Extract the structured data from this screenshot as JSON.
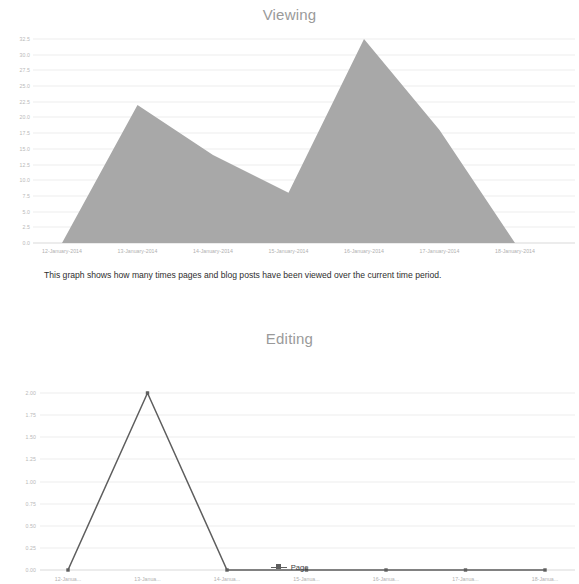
{
  "description": {
    "text": "This graph shows how many times pages and blog posts have been viewed over the current time period."
  },
  "colors": {
    "area_fill": "#a8a8a8",
    "line_stroke": "#5e5e5e",
    "title": "#9a9a9a",
    "grid": "#ededed",
    "tick_label": "#b9b9b9"
  },
  "legend": {
    "items": [
      {
        "label": "Page",
        "symbol": "line-marker",
        "color": "#5e5e5e"
      }
    ]
  },
  "chart_data": [
    {
      "type": "area",
      "title": "Viewing",
      "xlabel": "",
      "ylabel": "",
      "grid": true,
      "legend_position": "none",
      "categories": [
        "12-January-2014",
        "13-January-2014",
        "14-January-2014",
        "15-January-2014",
        "16-January-2014",
        "17-January-2014",
        "18-January-2014"
      ],
      "ytick_labels": [
        "32.5",
        "30.0",
        "27.5",
        "25.0",
        "22.5",
        "20.0",
        "17.5",
        "15.0",
        "12.5",
        "10.0",
        "7.5",
        "5.0",
        "2.5",
        "0.0"
      ],
      "ylim": [
        0,
        32.5
      ],
      "values": [
        0,
        22,
        14,
        8,
        32.5,
        18,
        0
      ]
    },
    {
      "type": "line",
      "title": "Editing",
      "xlabel": "",
      "ylabel": "",
      "grid": true,
      "legend_position": "bottom",
      "categories": [
        "12-Janua...",
        "13-Janua...",
        "14-Janua...",
        "15-Janua...",
        "16-Janua...",
        "17-Janua...",
        "18-Janua..."
      ],
      "ytick_labels": [
        "2.00",
        "1.75",
        "1.50",
        "1.25",
        "1.00",
        "0.75",
        "0.50",
        "0.25",
        "0.00"
      ],
      "ylim": [
        0,
        2
      ],
      "series": [
        {
          "name": "Page",
          "values": [
            0,
            2,
            0,
            0,
            0,
            0,
            0
          ]
        }
      ]
    }
  ]
}
